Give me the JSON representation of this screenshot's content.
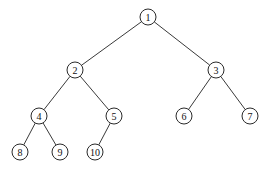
{
  "diagram": {
    "type": "binary-tree",
    "colors": {
      "stroke": "#2a2a2a",
      "background": "#ffffff",
      "text": "#111111"
    },
    "node_radius": 8,
    "nodes": [
      {
        "id": "1",
        "label": "1",
        "x": 148,
        "y": 17
      },
      {
        "id": "2",
        "label": "2",
        "x": 75,
        "y": 70
      },
      {
        "id": "3",
        "label": "3",
        "x": 216,
        "y": 70
      },
      {
        "id": "4",
        "label": "4",
        "x": 39,
        "y": 116
      },
      {
        "id": "5",
        "label": "5",
        "x": 114,
        "y": 116
      },
      {
        "id": "6",
        "label": "6",
        "x": 184,
        "y": 116
      },
      {
        "id": "7",
        "label": "7",
        "x": 250,
        "y": 116
      },
      {
        "id": "8",
        "label": "8",
        "x": 20,
        "y": 152
      },
      {
        "id": "9",
        "label": "9",
        "x": 60,
        "y": 152
      },
      {
        "id": "10",
        "label": "10",
        "x": 95,
        "y": 152
      }
    ],
    "edges": [
      {
        "from": "1",
        "to": "2"
      },
      {
        "from": "1",
        "to": "3"
      },
      {
        "from": "2",
        "to": "4"
      },
      {
        "from": "2",
        "to": "5"
      },
      {
        "from": "3",
        "to": "6"
      },
      {
        "from": "3",
        "to": "7"
      },
      {
        "from": "4",
        "to": "8"
      },
      {
        "from": "4",
        "to": "9"
      },
      {
        "from": "5",
        "to": "10"
      }
    ]
  }
}
